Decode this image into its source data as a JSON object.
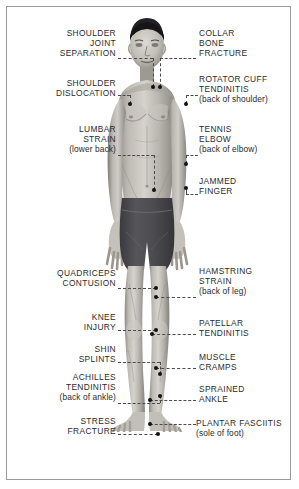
{
  "meta": {
    "figure_description": "Grayscale illustration of a standing male athlete in dark shorts, front view"
  },
  "colors": {
    "background": "#ffffff",
    "frame_border": "#9a9a9a",
    "text": "#2b2b2b",
    "leader_line": "#4a4a4a",
    "marker_dot": "#111111",
    "shorts": "#4a4a4e",
    "hair": "#1e1e20",
    "skin_light": "#d4d0cb",
    "skin_mid": "#a9a49e",
    "skin_shadow": "#7d7974"
  },
  "labels_left": [
    {
      "id": "shoulder-joint-separation",
      "lines": [
        "SHOULDER",
        "JOINT",
        "SEPARATION"
      ],
      "note": "",
      "x": 12,
      "y": 28,
      "w": 104,
      "leader": {
        "x": 118,
        "y": 58,
        "w": 35
      },
      "leader_v": {
        "x": 153,
        "y": 58,
        "h": 29
      },
      "dot": {
        "x": 151,
        "y": 85
      }
    },
    {
      "id": "shoulder-dislocation",
      "lines": [
        "SHOULDER",
        "DISLOCATION"
      ],
      "note": "",
      "x": 12,
      "y": 78,
      "w": 104,
      "leader": {
        "x": 118,
        "y": 95,
        "w": 12
      },
      "leader_v": {
        "x": 130,
        "y": 95,
        "h": 9
      },
      "dot": {
        "x": 128,
        "y": 102
      }
    },
    {
      "id": "lumbar-strain",
      "lines": [
        "LUMBAR",
        "STRAIN"
      ],
      "note": "(lower back)",
      "x": 12,
      "y": 124,
      "w": 104,
      "leader": {
        "x": 118,
        "y": 155,
        "w": 36
      },
      "leader_v": {
        "x": 154,
        "y": 155,
        "h": 35
      },
      "dot": {
        "x": 152,
        "y": 188
      }
    },
    {
      "id": "quadriceps-contusion",
      "lines": [
        "QUADRICEPS",
        "CONTUSION"
      ],
      "note": "",
      "x": 12,
      "y": 268,
      "w": 104,
      "leader": {
        "x": 118,
        "y": 288,
        "w": 38
      },
      "leader_v": null,
      "dot": {
        "x": 154,
        "y": 286
      }
    },
    {
      "id": "knee-injury",
      "lines": [
        "KNEE",
        "INJURY"
      ],
      "note": "",
      "x": 12,
      "y": 312,
      "w": 104,
      "leader": {
        "x": 118,
        "y": 330,
        "w": 38
      },
      "leader_v": null,
      "dot": {
        "x": 154,
        "y": 328
      }
    },
    {
      "id": "shin-splints",
      "lines": [
        "SHIN",
        "SPLINTS"
      ],
      "note": "",
      "x": 12,
      "y": 344,
      "w": 104,
      "leader": {
        "x": 118,
        "y": 362,
        "w": 42
      },
      "leader_v": {
        "x": 160,
        "y": 362,
        "h": 12
      },
      "dot": {
        "x": 158,
        "y": 372
      }
    },
    {
      "id": "achilles-tendinitis",
      "lines": [
        "ACHILLES",
        "TENDINITIS"
      ],
      "note": "(back of ankle)",
      "x": 8,
      "y": 372,
      "w": 108,
      "leader": {
        "x": 118,
        "y": 403,
        "w": 42
      },
      "leader_v": {
        "x": 160,
        "y": 396,
        "h": 7
      },
      "dot": {
        "x": 158,
        "y": 394
      }
    },
    {
      "id": "stress-fracture",
      "lines": [
        "STRESS",
        "FRACTURE"
      ],
      "note": "",
      "x": 12,
      "y": 416,
      "w": 104,
      "leader": {
        "x": 118,
        "y": 434,
        "w": 40
      },
      "leader_v": null,
      "dot": {
        "x": 156,
        "y": 432
      }
    }
  ],
  "labels_right": [
    {
      "id": "collar-bone-fracture",
      "lines": [
        "COLLAR",
        "BONE",
        "FRACTURE"
      ],
      "note": "",
      "x": 199,
      "y": 28,
      "w": 96,
      "leader": {
        "x": 160,
        "y": 58,
        "w": 36
      },
      "leader_v": {
        "x": 160,
        "y": 58,
        "h": 29
      },
      "dot": {
        "x": 158,
        "y": 85
      }
    },
    {
      "id": "rotator-cuff-tendinitis",
      "lines": [
        "ROTATOR CUFF",
        "TENDINITIS"
      ],
      "note": "(back of shoulder)",
      "x": 199,
      "y": 74,
      "w": 96,
      "leader": {
        "x": 186,
        "y": 95,
        "w": 12
      },
      "leader_v": {
        "x": 186,
        "y": 95,
        "h": 9
      },
      "dot": {
        "x": 184,
        "y": 102
      }
    },
    {
      "id": "tennis-elbow",
      "lines": [
        "TENNIS",
        "ELBOW"
      ],
      "note": "(back of elbow)",
      "x": 199,
      "y": 124,
      "w": 96,
      "leader": {
        "x": 186,
        "y": 155,
        "w": 12
      },
      "leader_v": {
        "x": 186,
        "y": 155,
        "h": 9
      },
      "dot": {
        "x": 184,
        "y": 162
      }
    },
    {
      "id": "jammed-finger",
      "lines": [
        "JAMMED",
        "FINGER"
      ],
      "note": "",
      "x": 199,
      "y": 176,
      "w": 96,
      "leader": {
        "x": 186,
        "y": 194,
        "w": 12
      },
      "leader_v": {
        "x": 186,
        "y": 188,
        "h": 6
      },
      "dot": {
        "x": 184,
        "y": 186
      }
    },
    {
      "id": "hamstring-strain",
      "lines": [
        "HAMSTRING",
        "STRAIN"
      ],
      "note": "(back of leg)",
      "x": 199,
      "y": 266,
      "w": 96,
      "leader": {
        "x": 156,
        "y": 297,
        "w": 40
      },
      "leader_v": null,
      "dot": {
        "x": 154,
        "y": 295
      }
    },
    {
      "id": "patellar-tendinitis",
      "lines": [
        "PATELLAR",
        "TENDINITIS"
      ],
      "note": "",
      "x": 199,
      "y": 318,
      "w": 96,
      "leader": {
        "x": 152,
        "y": 334,
        "w": 44
      },
      "leader_v": null,
      "dot": {
        "x": 150,
        "y": 332
      }
    },
    {
      "id": "muscle-cramps",
      "lines": [
        "MUSCLE",
        "CRAMPS"
      ],
      "note": "",
      "x": 199,
      "y": 352,
      "w": 96,
      "leader": {
        "x": 156,
        "y": 368,
        "w": 40
      },
      "leader_v": null,
      "dot": {
        "x": 154,
        "y": 366
      }
    },
    {
      "id": "sprained-ankle",
      "lines": [
        "SPRAINED",
        "ANKLE"
      ],
      "note": "",
      "x": 199,
      "y": 384,
      "w": 96,
      "leader": {
        "x": 150,
        "y": 400,
        "w": 46
      },
      "leader_v": null,
      "dot": {
        "x": 148,
        "y": 398
      }
    },
    {
      "id": "plantar-fasciitis",
      "lines": [
        "PLANTAR FASCIITIS"
      ],
      "note": "(sole of foot)",
      "x": 196,
      "y": 418,
      "w": 100,
      "leader": {
        "x": 150,
        "y": 424,
        "w": 46
      },
      "leader_v": null,
      "dot": {
        "x": 148,
        "y": 422
      }
    }
  ]
}
